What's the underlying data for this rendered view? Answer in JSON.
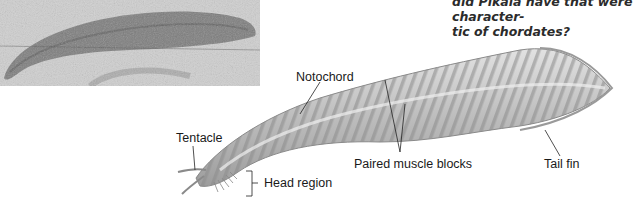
{
  "question": {
    "line1": "did Pikaia have that were character-",
    "line2": "tic of chordates?"
  },
  "photo": {
    "description": "fossil-photograph"
  },
  "labels": {
    "notochord": "Notochord",
    "tentacle": "Tentacle",
    "head_region": "Head region",
    "paired_muscle_blocks": "Paired muscle blocks",
    "tail_fin": "Tail fin"
  },
  "colors": {
    "body_light": "#d8d8d8",
    "body_dark": "#9a9a9a",
    "text": "#1a1a1a"
  }
}
